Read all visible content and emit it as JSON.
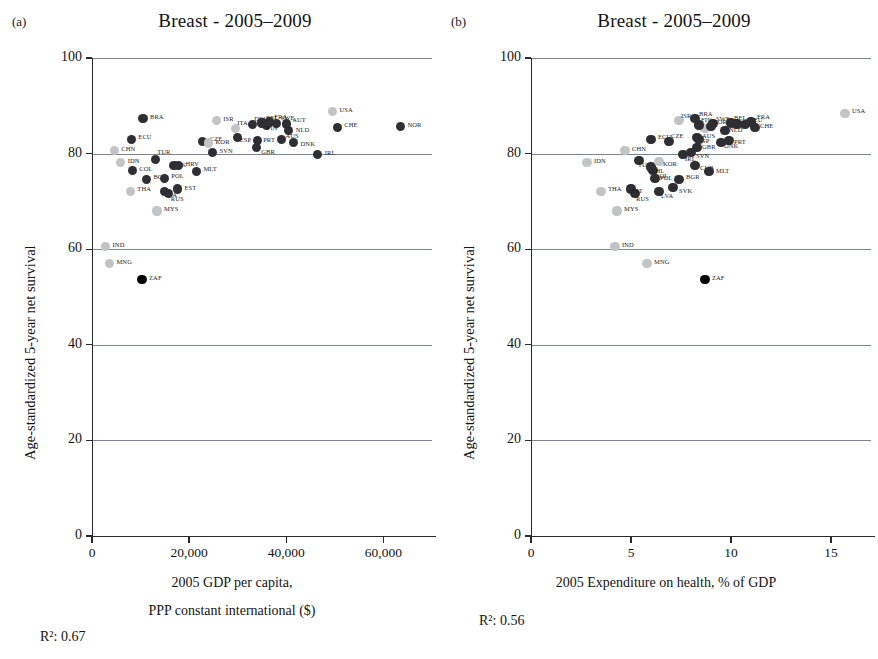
{
  "figure": {
    "width": 878,
    "height": 659,
    "colors": {
      "marker_dark": "#2f2f33",
      "marker_black": "#000000",
      "marker_light": "#c3c4c6",
      "gridline": "#7b8493",
      "axis": "#2a2a2a",
      "text": "#141414"
    }
  },
  "panels": [
    {
      "tag": "(a)",
      "chart_data": {
        "type": "scatter",
        "title": "Breast - 2005–2009",
        "xlabel_line1": "2005 GDP per capita,",
        "xlabel_line2": "PPP constant international ($)",
        "ylabel": "Age-standardized 5-year net survival",
        "r2_label": "R²: 0.67",
        "xlim": [
          0,
          70000
        ],
        "ylim": [
          0,
          100
        ],
        "xticks": [
          0,
          20000,
          40000,
          60000
        ],
        "xtick_labels": [
          "0",
          "20,000",
          "40,000",
          "60,000"
        ],
        "yticks": [
          0,
          20,
          40,
          60,
          80,
          100
        ],
        "ytick_labels": [
          "0",
          "20",
          "40",
          "60",
          "80",
          "100"
        ],
        "grid": "horizontal",
        "legend": "none",
        "points": [
          {
            "label": "BRA",
            "x": 10500,
            "y": 87.3,
            "shade": "dark",
            "lx": 7,
            "ly": -3
          },
          {
            "label": "ECU",
            "x": 8100,
            "y": 83.0,
            "shade": "dark",
            "lx": 7,
            "ly": -3
          },
          {
            "label": "CHN",
            "x": 4600,
            "y": 80.6,
            "shade": "light",
            "lx": 7,
            "ly": -3
          },
          {
            "label": "IDN",
            "x": 5900,
            "y": 78.1,
            "shade": "light",
            "lx": 7,
            "ly": -3
          },
          {
            "label": "COL",
            "x": 8300,
            "y": 76.4,
            "shade": "dark",
            "lx": 7,
            "ly": -3
          },
          {
            "label": "THA",
            "x": 7900,
            "y": 72.1,
            "shade": "light",
            "lx": 7,
            "ly": -3
          },
          {
            "label": "MNG",
            "x": 3600,
            "y": 57.0,
            "shade": "light",
            "lx": 7,
            "ly": -3
          },
          {
            "label": "IND",
            "x": 2800,
            "y": 60.5,
            "shade": "light",
            "lx": 7,
            "ly": -3
          },
          {
            "label": "ZAF",
            "x": 10300,
            "y": 53.6,
            "shade": "black",
            "lx": 7,
            "ly": -3
          },
          {
            "label": "BGR",
            "x": 11200,
            "y": 74.6,
            "shade": "dark",
            "lx": 7,
            "ly": -3
          },
          {
            "label": "TUR",
            "x": 13000,
            "y": 78.7,
            "shade": "dark",
            "lx": 2,
            "ly": -9
          },
          {
            "label": "POL",
            "x": 14900,
            "y": 74.8,
            "shade": "dark",
            "lx": 7,
            "ly": -3
          },
          {
            "label": "SVK",
            "x": 16900,
            "y": 77.5,
            "shade": "dark",
            "lx": -1,
            "ly": -2
          },
          {
            "label": "HRV",
            "x": 17800,
            "y": 77.5,
            "shade": "dark",
            "lx": 7,
            "ly": -3
          },
          {
            "label": "LVA",
            "x": 15000,
            "y": 72.1,
            "shade": "dark",
            "lx": 0,
            "ly": 3
          },
          {
            "label": "RUS",
            "x": 15800,
            "y": 71.6,
            "shade": "dark",
            "lx": 2,
            "ly": 4
          },
          {
            "label": "EST",
            "x": 17600,
            "y": 72.6,
            "shade": "dark",
            "lx": 7,
            "ly": -2
          },
          {
            "label": "MYS",
            "x": 13400,
            "y": 68.0,
            "shade": "light",
            "lx": 7,
            "ly": -3
          },
          {
            "label": "MLT",
            "x": 21500,
            "y": 76.3,
            "shade": "dark",
            "lx": 7,
            "ly": -3
          },
          {
            "label": "SVN",
            "x": 24800,
            "y": 80.2,
            "shade": "dark",
            "lx": 7,
            "ly": -3
          },
          {
            "label": "CZE",
            "x": 22800,
            "y": 82.6,
            "shade": "dark",
            "lx": 7,
            "ly": -3
          },
          {
            "label": "ISR",
            "x": 25600,
            "y": 86.9,
            "shade": "light",
            "lx": 7,
            "ly": -3
          },
          {
            "label": "KOR",
            "x": 24000,
            "y": 82.2,
            "shade": "light",
            "lx": 7,
            "ly": -2
          },
          {
            "label": "ESP",
            "x": 30000,
            "y": 83.4,
            "shade": "dark",
            "lx": 2,
            "ly": 2
          },
          {
            "label": "ITA",
            "x": 29500,
            "y": 85.2,
            "shade": "light",
            "lx": 2,
            "ly": -7
          },
          {
            "label": "GBR",
            "x": 33800,
            "y": 81.2,
            "shade": "dark",
            "lx": 5,
            "ly": 3
          },
          {
            "label": "PRT",
            "x": 34000,
            "y": 82.7,
            "shade": "dark",
            "lx": 6,
            "ly": -2
          },
          {
            "label": "DEU",
            "x": 33000,
            "y": 86.1,
            "shade": "dark",
            "lx": 2,
            "ly": -6
          },
          {
            "label": "BEL",
            "x": 35000,
            "y": 86.4,
            "shade": "dark",
            "lx": 4,
            "ly": -6
          },
          {
            "label": "FRA",
            "x": 36500,
            "y": 86.6,
            "shade": "dark",
            "lx": 5,
            "ly": -6
          },
          {
            "label": "SWE",
            "x": 38000,
            "y": 86.3,
            "shade": "dark",
            "lx": 4,
            "ly": -6
          },
          {
            "label": "FIN",
            "x": 36000,
            "y": 86.0,
            "shade": "dark",
            "lx": 0,
            "ly": 2
          },
          {
            "label": "AUT",
            "x": 40000,
            "y": 86.2,
            "shade": "dark",
            "lx": 6,
            "ly": -5
          },
          {
            "label": "NLD",
            "x": 40500,
            "y": 84.9,
            "shade": "dark",
            "lx": 7,
            "ly": -1
          },
          {
            "label": "AUS",
            "x": 39000,
            "y": 82.9,
            "shade": "dark",
            "lx": 4,
            "ly": -5
          },
          {
            "label": "DNK",
            "x": 41500,
            "y": 82.3,
            "shade": "dark",
            "lx": 7,
            "ly": 0
          },
          {
            "label": "IRL",
            "x": 46500,
            "y": 79.8,
            "shade": "dark",
            "lx": 7,
            "ly": -3
          },
          {
            "label": "USA",
            "x": 49500,
            "y": 88.8,
            "shade": "light",
            "lx": 7,
            "ly": -3
          },
          {
            "label": "CHE",
            "x": 50500,
            "y": 85.5,
            "shade": "dark",
            "lx": 7,
            "ly": -3
          },
          {
            "label": "NOR",
            "x": 63500,
            "y": 85.6,
            "shade": "dark",
            "lx": 7,
            "ly": -3
          }
        ]
      }
    },
    {
      "tag": "(b)",
      "chart_data": {
        "type": "scatter",
        "title": "Breast - 2005–2009",
        "xlabel_line1": "2005 Expenditure on health, % of GDP",
        "xlabel_line2": "",
        "ylabel": "Age-standardized 5-year net survival",
        "r2_label": "R²: 0.56",
        "xlim": [
          0,
          17
        ],
        "ylim": [
          0,
          100
        ],
        "xticks": [
          0,
          5,
          10,
          15
        ],
        "xtick_labels": [
          "0",
          "5",
          "10",
          "15"
        ],
        "yticks": [
          0,
          20,
          40,
          60,
          80,
          100
        ],
        "ytick_labels": [
          "0",
          "20",
          "40",
          "60",
          "80",
          "100"
        ],
        "grid": "horizontal",
        "legend": "none",
        "points": [
          {
            "label": "CHN",
            "x": 4.7,
            "y": 80.6,
            "shade": "light",
            "lx": 7,
            "ly": -3
          },
          {
            "label": "IDN",
            "x": 2.8,
            "y": 78.1,
            "shade": "light",
            "lx": 7,
            "ly": -3
          },
          {
            "label": "ECU",
            "x": 6.0,
            "y": 83.0,
            "shade": "dark",
            "lx": 7,
            "ly": -3
          },
          {
            "label": "BRA",
            "x": 8.2,
            "y": 87.3,
            "shade": "dark",
            "lx": 4,
            "ly": -6
          },
          {
            "label": "TUR",
            "x": 5.4,
            "y": 78.5,
            "shade": "dark",
            "lx": -1,
            "ly": 3
          },
          {
            "label": "COL",
            "x": 6.1,
            "y": 76.4,
            "shade": "dark",
            "lx": 2,
            "ly": 4
          },
          {
            "label": "THA",
            "x": 3.5,
            "y": 72.1,
            "shade": "light",
            "lx": 7,
            "ly": -3
          },
          {
            "label": "MYS",
            "x": 4.3,
            "y": 68.0,
            "shade": "light",
            "lx": 7,
            "ly": -3
          },
          {
            "label": "IND",
            "x": 4.2,
            "y": 60.5,
            "shade": "light",
            "lx": 7,
            "ly": -3
          },
          {
            "label": "MNG",
            "x": 5.8,
            "y": 57.0,
            "shade": "light",
            "lx": 7,
            "ly": -3
          },
          {
            "label": "ZAF",
            "x": 8.7,
            "y": 53.6,
            "shade": "black",
            "lx": 7,
            "ly": -3
          },
          {
            "label": "RUS",
            "x": 5.2,
            "y": 71.6,
            "shade": "dark",
            "lx": 1,
            "ly": 4
          },
          {
            "label": "EST",
            "x": 5.0,
            "y": 72.6,
            "shade": "dark",
            "lx": 0,
            "ly": 1
          },
          {
            "label": "LVA",
            "x": 6.4,
            "y": 72.1,
            "shade": "dark",
            "lx": 2,
            "ly": 4
          },
          {
            "label": "SVK",
            "x": 7.1,
            "y": 72.9,
            "shade": "dark",
            "lx": 6,
            "ly": 2
          },
          {
            "label": "POL",
            "x": 6.2,
            "y": 74.8,
            "shade": "dark",
            "lx": 5,
            "ly": -1
          },
          {
            "label": "BGR",
            "x": 7.4,
            "y": 74.6,
            "shade": "dark",
            "lx": 7,
            "ly": -3
          },
          {
            "label": "CHL",
            "x": 6.0,
            "y": 77.2,
            "shade": "dark",
            "lx": 0,
            "ly": 3
          },
          {
            "label": "KOR",
            "x": 6.4,
            "y": 78.4,
            "shade": "light",
            "lx": 4,
            "ly": 2
          },
          {
            "label": "CUB",
            "x": 8.2,
            "y": 77.5,
            "shade": "dark",
            "lx": 5,
            "ly": 1
          },
          {
            "label": "MLT",
            "x": 8.9,
            "y": 76.3,
            "shade": "dark",
            "lx": 7,
            "ly": -1
          },
          {
            "label": "SVN",
            "x": 8.0,
            "y": 80.2,
            "shade": "dark",
            "lx": 5,
            "ly": 2
          },
          {
            "label": "CZE",
            "x": 6.9,
            "y": 82.6,
            "shade": "dark",
            "lx": 2,
            "ly": -6
          },
          {
            "label": "ISR",
            "x": 7.4,
            "y": 86.9,
            "shade": "light",
            "lx": 2,
            "ly": -6
          },
          {
            "label": "GBR",
            "x": 8.3,
            "y": 81.2,
            "shade": "dark",
            "lx": 5,
            "ly": -2
          },
          {
            "label": "ESP",
            "x": 8.3,
            "y": 83.4,
            "shade": "dark",
            "lx": 1,
            "ly": 3
          },
          {
            "label": "ITA",
            "x": 8.7,
            "y": 85.2,
            "shade": "light",
            "lx": 2,
            "ly": -5
          },
          {
            "label": "AUS",
            "x": 8.4,
            "y": 82.9,
            "shade": "dark",
            "lx": 3,
            "ly": -5
          },
          {
            "label": "FIN",
            "x": 8.4,
            "y": 86.0,
            "shade": "dark",
            "lx": 2,
            "ly": -6
          },
          {
            "label": "PRT",
            "x": 9.9,
            "y": 82.7,
            "shade": "dark",
            "lx": 5,
            "ly": 0
          },
          {
            "label": "DNK",
            "x": 9.5,
            "y": 82.3,
            "shade": "dark",
            "lx": 3,
            "ly": 2
          },
          {
            "label": "SWE",
            "x": 9.1,
            "y": 86.3,
            "shade": "dark",
            "lx": 3,
            "ly": -5
          },
          {
            "label": "NLD",
            "x": 9.7,
            "y": 84.9,
            "shade": "dark",
            "lx": 4,
            "ly": -1
          },
          {
            "label": "NOR",
            "x": 9.0,
            "y": 85.6,
            "shade": "dark",
            "lx": 2,
            "ly": -6
          },
          {
            "label": "AUT",
            "x": 10.3,
            "y": 86.2,
            "shade": "dark",
            "lx": 6,
            "ly": -4
          },
          {
            "label": "IRL",
            "x": 7.6,
            "y": 79.8,
            "shade": "dark",
            "lx": 2,
            "ly": 3
          },
          {
            "label": "DEU",
            "x": 10.7,
            "y": 86.1,
            "shade": "dark",
            "lx": 4,
            "ly": -5
          },
          {
            "label": "BEL",
            "x": 10.0,
            "y": 86.4,
            "shade": "dark",
            "lx": 3,
            "ly": -6
          },
          {
            "label": "FRA",
            "x": 11.0,
            "y": 86.6,
            "shade": "dark",
            "lx": 6,
            "ly": -6
          },
          {
            "label": "CHE",
            "x": 11.2,
            "y": 85.5,
            "shade": "dark",
            "lx": 5,
            "ly": -2
          },
          {
            "label": "USA",
            "x": 15.7,
            "y": 88.4,
            "shade": "light",
            "lx": 7,
            "ly": -3
          }
        ]
      }
    }
  ]
}
